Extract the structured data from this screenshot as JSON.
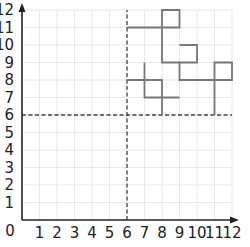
{
  "chart_data": {
    "type": "line",
    "title": "",
    "xlabel": "",
    "ylabel": "",
    "xlim": [
      0,
      12
    ],
    "ylim": [
      0,
      12
    ],
    "grid": true,
    "x_ticks": [
      "1",
      "2",
      "3",
      "4",
      "5",
      "6",
      "7",
      "8",
      "9",
      "10",
      "11",
      "12"
    ],
    "y_ticks": [
      "1",
      "2",
      "3",
      "4",
      "5",
      "6",
      "7",
      "8",
      "9",
      "10",
      "11",
      "12"
    ],
    "origin_label": "0",
    "dashed_lines": [
      {
        "orientation": "vertical",
        "x": 6
      },
      {
        "orientation": "horizontal",
        "y": 6
      }
    ],
    "segments": [
      {
        "name": "shape-top",
        "points": [
          [
            6,
            11
          ],
          [
            9,
            11
          ],
          [
            9,
            12
          ],
          [
            8,
            12
          ],
          [
            8,
            9
          ],
          [
            9,
            9
          ]
        ]
      },
      {
        "name": "shape-right",
        "points": [
          [
            9,
            10
          ],
          [
            10,
            10
          ],
          [
            10,
            9
          ],
          [
            9,
            9
          ],
          [
            9,
            8
          ],
          [
            12,
            8
          ],
          [
            12,
            9
          ],
          [
            11,
            9
          ],
          [
            11,
            6
          ]
        ]
      },
      {
        "name": "shape-left",
        "points": [
          [
            6,
            8
          ],
          [
            8,
            8
          ],
          [
            8,
            6
          ]
        ]
      },
      {
        "name": "shape-left-cross",
        "points": [
          [
            7,
            9
          ],
          [
            7,
            7
          ],
          [
            9,
            7
          ]
        ]
      }
    ],
    "colors": {
      "axis": "#222222",
      "grid": "#e8e8e8",
      "shape": "#777777",
      "dashed": "#444444"
    }
  }
}
